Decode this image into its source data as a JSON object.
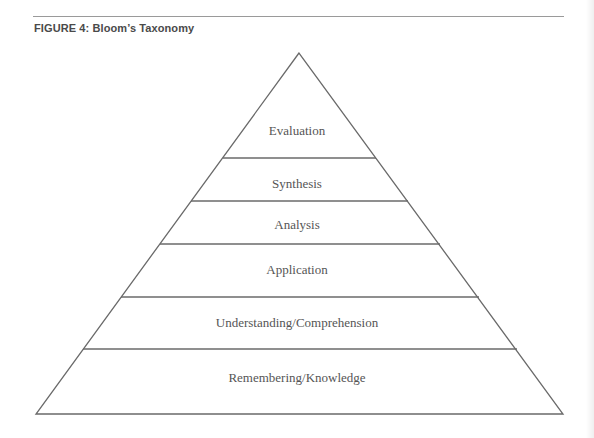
{
  "figure": {
    "title": "FIGURE 4:  Bloom’s Taxonomy"
  },
  "pyramid": {
    "levels": [
      {
        "label": "Evaluation"
      },
      {
        "label": "Synthesis"
      },
      {
        "label": "Analysis"
      },
      {
        "label": "Application"
      },
      {
        "label": "Understanding/Comprehension"
      },
      {
        "label": "Remembering/Knowledge"
      }
    ],
    "colors": {
      "line": "#6a6a6a",
      "text": "#555555",
      "title": "#4a4a4a"
    }
  }
}
